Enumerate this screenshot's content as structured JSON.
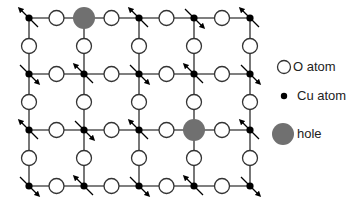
{
  "diagram": {
    "type": "CuO2 plane lattice with spins and holes",
    "colors": {
      "line": "#555555",
      "cu": "#000000",
      "o_fill": "#ffffff",
      "o_stroke": "#333333",
      "hole": "#707070"
    },
    "grid": {
      "cols_x": [
        29,
        84,
        139,
        194,
        250
      ],
      "rows_y": [
        18,
        74,
        130,
        186
      ]
    },
    "cu_sites": [
      {
        "row": 0,
        "col": 0,
        "spin": "up"
      },
      {
        "row": 0,
        "col": 1,
        "hole": true
      },
      {
        "row": 0,
        "col": 2,
        "spin": "up"
      },
      {
        "row": 0,
        "col": 3,
        "spin": "down"
      },
      {
        "row": 0,
        "col": 4,
        "spin": "up"
      },
      {
        "row": 1,
        "col": 0,
        "spin": "down"
      },
      {
        "row": 1,
        "col": 1,
        "spin": "up"
      },
      {
        "row": 1,
        "col": 2,
        "spin": "down"
      },
      {
        "row": 1,
        "col": 3,
        "spin": "up"
      },
      {
        "row": 1,
        "col": 4,
        "spin": "down"
      },
      {
        "row": 2,
        "col": 0,
        "spin": "up"
      },
      {
        "row": 2,
        "col": 1,
        "spin": "down"
      },
      {
        "row": 2,
        "col": 2,
        "spin": "up"
      },
      {
        "row": 2,
        "col": 3,
        "hole": true
      },
      {
        "row": 2,
        "col": 4,
        "spin": "up"
      },
      {
        "row": 3,
        "col": 0,
        "spin": "down"
      },
      {
        "row": 3,
        "col": 1,
        "spin": "up"
      },
      {
        "row": 3,
        "col": 2,
        "spin": "down"
      },
      {
        "row": 3,
        "col": 3,
        "spin": "up"
      },
      {
        "row": 3,
        "col": 4,
        "spin": "down"
      }
    ]
  },
  "legend": {
    "items": [
      {
        "label": "O atom",
        "symbol": "open-circle"
      },
      {
        "label": "Cu atom",
        "symbol": "black-dot"
      },
      {
        "label": "hole",
        "symbol": "gray-filled-circle"
      }
    ]
  }
}
